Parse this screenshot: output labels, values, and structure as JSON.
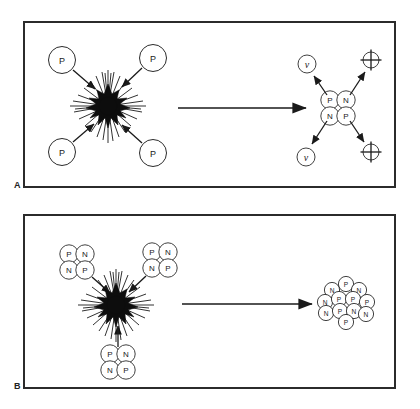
{
  "figure": {
    "background_color": "#ffffff",
    "ink_color": "#1a1a1a",
    "frame_color": "#2b2b2b",
    "panels": [
      {
        "id": "A",
        "label": "A",
        "caption": "Hydrogen fusion: four protons fuse into a helium nucleus, emitting two neutrinos and two positrons",
        "reactants": {
          "label": "P",
          "name": "proton",
          "count": 4,
          "items": [
            {
              "label": "P",
              "position": "upper-left"
            },
            {
              "label": "P",
              "position": "upper-right"
            },
            {
              "label": "P",
              "position": "lower-left"
            },
            {
              "label": "P",
              "position": "lower-right"
            }
          ]
        },
        "reaction_site": {
          "name": "fusion-burst",
          "style": "black-starburst"
        },
        "arrow": {
          "name": "reaction-arrow",
          "direction": "right"
        },
        "product": {
          "name": "helium-nucleus",
          "nucleons": [
            {
              "label": "P",
              "position": "top-left"
            },
            {
              "label": "N",
              "position": "top-right"
            },
            {
              "label": "N",
              "position": "bottom-left"
            },
            {
              "label": "P",
              "position": "bottom-right"
            }
          ]
        },
        "emissions": [
          {
            "label": "ν",
            "name": "neutrino",
            "position": "upper-left",
            "style": "circled-letter"
          },
          {
            "label": "⊕",
            "name": "positron",
            "position": "upper-right",
            "style": "circled-plus"
          },
          {
            "label": "ν",
            "name": "neutrino",
            "position": "lower-left",
            "style": "circled-letter"
          },
          {
            "label": "⊕",
            "name": "positron",
            "position": "lower-right",
            "style": "circled-plus"
          }
        ]
      },
      {
        "id": "B",
        "label": "B",
        "caption": "Helium fusion: three helium nuclei fuse into a carbon nucleus",
        "reactants": {
          "name": "helium-nucleus",
          "count": 3,
          "items": [
            {
              "position": "upper-left",
              "nucleons": [
                {
                  "label": "P",
                  "position": "top-left"
                },
                {
                  "label": "N",
                  "position": "top-right"
                },
                {
                  "label": "N",
                  "position": "bottom-left"
                },
                {
                  "label": "P",
                  "position": "bottom-right"
                }
              ]
            },
            {
              "position": "upper-right",
              "nucleons": [
                {
                  "label": "P",
                  "position": "top-left"
                },
                {
                  "label": "N",
                  "position": "top-right"
                },
                {
                  "label": "N",
                  "position": "bottom-left"
                },
                {
                  "label": "P",
                  "position": "bottom-right"
                }
              ]
            },
            {
              "position": "bottom",
              "nucleons": [
                {
                  "label": "P",
                  "position": "top-left"
                },
                {
                  "label": "N",
                  "position": "top-right"
                },
                {
                  "label": "N",
                  "position": "bottom-left"
                },
                {
                  "label": "P",
                  "position": "bottom-right"
                }
              ]
            }
          ]
        },
        "reaction_site": {
          "name": "fusion-burst",
          "style": "black-starburst"
        },
        "arrow": {
          "name": "reaction-arrow",
          "direction": "right"
        },
        "product": {
          "name": "carbon-nucleus",
          "nucleon_count": 12,
          "nucleons": [
            {
              "label": "P",
              "index": 1
            },
            {
              "label": "N",
              "index": 2
            },
            {
              "label": "N",
              "index": 3
            },
            {
              "label": "N",
              "index": 4
            },
            {
              "label": "P",
              "index": 5
            },
            {
              "label": "P",
              "index": 6
            },
            {
              "label": "P",
              "index": 7
            },
            {
              "label": "N",
              "index": 8
            },
            {
              "label": "P",
              "index": 9
            },
            {
              "label": "N",
              "index": 10
            },
            {
              "label": "N",
              "index": 11
            },
            {
              "label": "P",
              "index": 12
            }
          ]
        }
      }
    ]
  }
}
